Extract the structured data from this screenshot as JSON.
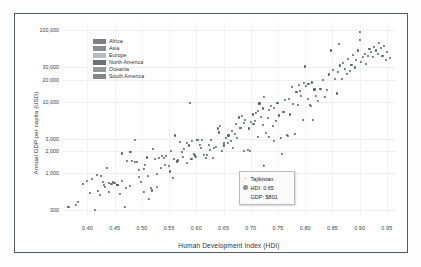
{
  "chart_data": {
    "type": "scatter",
    "title": "",
    "xlabel": "Human Development Index (HDI)",
    "ylabel": "Annual GDP per capita (USD)",
    "yscale": "log",
    "xlim": [
      0.355,
      0.965
    ],
    "ylim": [
      250,
      130000
    ],
    "grid": true,
    "legend_position": "top-left-inside",
    "xticks": [
      "0.40",
      "0.45",
      "0.50",
      "0.55",
      "0.60",
      "0.65",
      "0.70",
      "0.75",
      "0.80",
      "0.85",
      "0.90",
      "0.95"
    ],
    "xtick_values": [
      0.4,
      0.45,
      0.5,
      0.55,
      0.6,
      0.65,
      0.7,
      0.75,
      0.8,
      0.85,
      0.9,
      0.95
    ],
    "yticks": [
      "100,000",
      "30,000",
      "20,000",
      "10,000",
      "3,000",
      "2,000",
      "1,000",
      "300"
    ],
    "ytick_values": [
      100000,
      30000,
      20000,
      10000,
      3000,
      2000,
      1000,
      300
    ],
    "series": [
      {
        "name": "Countries",
        "color": "#5c6063",
        "points": [
          [
            0.365,
            335
          ],
          [
            0.378,
            360
          ],
          [
            0.383,
            392
          ],
          [
            0.392,
            700
          ],
          [
            0.399,
            770
          ],
          [
            0.404,
            520
          ],
          [
            0.409,
            815
          ],
          [
            0.413,
            300
          ],
          [
            0.417,
            930
          ],
          [
            0.42,
            560
          ],
          [
            0.424,
            905
          ],
          [
            0.428,
            740
          ],
          [
            0.432,
            640
          ],
          [
            0.436,
            1190
          ],
          [
            0.44,
            720
          ],
          [
            0.444,
            700
          ],
          [
            0.448,
            735
          ],
          [
            0.451,
            720
          ],
          [
            0.455,
            690
          ],
          [
            0.459,
            505
          ],
          [
            0.464,
            1880
          ],
          [
            0.468,
            330
          ],
          [
            0.473,
            1460
          ],
          [
            0.478,
            660
          ],
          [
            0.482,
            1470
          ],
          [
            0.487,
            2930
          ],
          [
            0.491,
            1420
          ],
          [
            0.495,
            1110
          ],
          [
            0.499,
            760
          ],
          [
            0.503,
            550
          ],
          [
            0.506,
            1290
          ],
          [
            0.51,
            1650
          ],
          [
            0.513,
            430
          ],
          [
            0.517,
            620
          ],
          [
            0.52,
            2150
          ],
          [
            0.524,
            1560
          ],
          [
            0.528,
            960
          ],
          [
            0.532,
            1640
          ],
          [
            0.536,
            1720
          ],
          [
            0.54,
            1630
          ],
          [
            0.544,
            1720
          ],
          [
            0.549,
            1240
          ],
          [
            0.553,
            2050
          ],
          [
            0.557,
            850
          ],
          [
            0.561,
            3350
          ],
          [
            0.565,
            1450
          ],
          [
            0.57,
            2760
          ],
          [
            0.574,
            1960
          ],
          [
            0.578,
            2140
          ],
          [
            0.582,
            2600
          ],
          [
            0.586,
            2430
          ],
          [
            0.589,
            9600
          ],
          [
            0.592,
            2800
          ],
          [
            0.595,
            1830
          ],
          [
            0.598,
            1760
          ],
          [
            0.602,
            2900
          ],
          [
            0.606,
            2500
          ],
          [
            0.61,
            2870
          ],
          [
            0.614,
            1800
          ],
          [
            0.619,
            1790
          ],
          [
            0.623,
            2440
          ],
          [
            0.627,
            2920
          ],
          [
            0.631,
            1630
          ],
          [
            0.636,
            2290
          ],
          [
            0.64,
            4200
          ],
          [
            0.644,
            4600
          ],
          [
            0.647,
            2050
          ],
          [
            0.651,
            2430
          ],
          [
            0.655,
            3080
          ],
          [
            0.659,
            3350
          ],
          [
            0.663,
            2780
          ],
          [
            0.667,
            2220
          ],
          [
            0.671,
            3470
          ],
          [
            0.675,
            3100
          ],
          [
            0.679,
            6000
          ],
          [
            0.683,
            6200
          ],
          [
            0.687,
            2030
          ],
          [
            0.69,
            5600
          ],
          [
            0.694,
            2100
          ],
          [
            0.698,
            2050
          ],
          [
            0.701,
            5200
          ],
          [
            0.704,
            6600
          ],
          [
            0.707,
            5300
          ],
          [
            0.71,
            7000
          ],
          [
            0.713,
            3180
          ],
          [
            0.716,
            9400
          ],
          [
            0.719,
            6100
          ],
          [
            0.722,
            4700
          ],
          [
            0.725,
            11500
          ],
          [
            0.728,
            3600
          ],
          [
            0.731,
            5900
          ],
          [
            0.734,
            3240
          ],
          [
            0.737,
            8600
          ],
          [
            0.74,
            4550
          ],
          [
            0.743,
            2840
          ],
          [
            0.746,
            5400
          ],
          [
            0.749,
            9500
          ],
          [
            0.752,
            6400
          ],
          [
            0.755,
            3100
          ],
          [
            0.757,
            1850
          ],
          [
            0.76,
            7100
          ],
          [
            0.763,
            10500
          ],
          [
            0.766,
            3400
          ],
          [
            0.769,
            3300
          ],
          [
            0.772,
            6600
          ],
          [
            0.775,
            16000
          ],
          [
            0.778,
            9300
          ],
          [
            0.781,
            3500
          ],
          [
            0.784,
            13500
          ],
          [
            0.787,
            8900
          ],
          [
            0.79,
            14000
          ],
          [
            0.793,
            12000
          ],
          [
            0.796,
            5600
          ],
          [
            0.799,
            31000
          ],
          [
            0.802,
            16500
          ],
          [
            0.805,
            11000
          ],
          [
            0.808,
            9000
          ],
          [
            0.811,
            8700
          ],
          [
            0.814,
            5500
          ],
          [
            0.817,
            14800
          ],
          [
            0.82,
            12000
          ],
          [
            0.824,
            10200
          ],
          [
            0.828,
            15000
          ],
          [
            0.832,
            20000
          ],
          [
            0.836,
            11500
          ],
          [
            0.84,
            14500
          ],
          [
            0.844,
            24000
          ],
          [
            0.848,
            52000
          ],
          [
            0.851,
            28000
          ],
          [
            0.855,
            21000
          ],
          [
            0.858,
            13000
          ],
          [
            0.861,
            26000
          ],
          [
            0.864,
            32000
          ],
          [
            0.867,
            20500
          ],
          [
            0.87,
            35000
          ],
          [
            0.873,
            29000
          ],
          [
            0.876,
            24500
          ],
          [
            0.879,
            40000
          ],
          [
            0.882,
            27000
          ],
          [
            0.885,
            33000
          ],
          [
            0.888,
            45000
          ],
          [
            0.891,
            30000
          ],
          [
            0.894,
            38000
          ],
          [
            0.897,
            52000
          ],
          [
            0.9,
            95000
          ],
          [
            0.903,
            36000
          ],
          [
            0.906,
            42000
          ],
          [
            0.909,
            47000
          ],
          [
            0.912,
            34000
          ],
          [
            0.915,
            44000
          ],
          [
            0.918,
            55000
          ],
          [
            0.921,
            49000
          ],
          [
            0.924,
            42000
          ],
          [
            0.927,
            58000
          ],
          [
            0.93,
            52000
          ],
          [
            0.933,
            46000
          ],
          [
            0.936,
            66000
          ],
          [
            0.939,
            56000
          ],
          [
            0.942,
            43000
          ],
          [
            0.945,
            60000
          ],
          [
            0.948,
            38000
          ],
          [
            0.951,
            49000
          ],
          [
            0.955,
            41000
          ],
          [
            0.9,
            72000
          ],
          [
            0.862,
            64000
          ],
          [
            0.812,
            18500
          ],
          [
            0.806,
            17800
          ],
          [
            0.797,
            18200
          ],
          [
            0.789,
            17000
          ],
          [
            0.77,
            10800
          ],
          [
            0.743,
            8100
          ],
          [
            0.733,
            7600
          ],
          [
            0.723,
            8000
          ],
          [
            0.714,
            7400
          ],
          [
            0.705,
            4900
          ],
          [
            0.697,
            4200
          ],
          [
            0.688,
            5000
          ],
          [
            0.681,
            4300
          ],
          [
            0.673,
            4800
          ],
          [
            0.665,
            3900
          ],
          [
            0.658,
            2600
          ],
          [
            0.65,
            2650
          ],
          [
            0.641,
            3700
          ],
          [
            0.633,
            2250
          ],
          [
            0.625,
            2100
          ],
          [
            0.617,
            1620
          ],
          [
            0.608,
            2250
          ],
          [
            0.6,
            1680
          ],
          [
            0.591,
            1550
          ],
          [
            0.583,
            1380
          ],
          [
            0.575,
            1690
          ],
          [
            0.567,
            1500
          ],
          [
            0.559,
            1580
          ],
          [
            0.551,
            1050
          ],
          [
            0.543,
            1300
          ],
          [
            0.535,
            1160
          ],
          [
            0.527,
            640
          ],
          [
            0.519,
            570
          ],
          [
            0.511,
            900
          ],
          [
            0.503,
            1150
          ],
          [
            0.495,
            870
          ],
          [
            0.487,
            1440
          ],
          [
            0.479,
            1980
          ],
          [
            0.471,
            620
          ],
          [
            0.463,
            780
          ],
          [
            0.455,
            690
          ],
          [
            0.447,
            750
          ],
          [
            0.439,
            540
          ],
          [
            0.431,
            680
          ],
          [
            0.423,
            490
          ]
        ]
      }
    ],
    "legend_entries": [
      {
        "label": "Africa",
        "color": "#7c8084"
      },
      {
        "label": "Asia",
        "color": "#8a8e92"
      },
      {
        "label": "Europe",
        "color": "#b9bcbf"
      },
      {
        "label": "North America",
        "color": "#6e7276"
      },
      {
        "label": "Oceania",
        "color": "#95999c"
      },
      {
        "label": "South America",
        "color": "#83878b"
      }
    ],
    "tooltip": {
      "country": "Tajikistan",
      "hdi_label": "HDI: 0.65",
      "gdp_label": "GDP: $801",
      "hdi_value": 0.65,
      "gdp_value": 801
    }
  }
}
